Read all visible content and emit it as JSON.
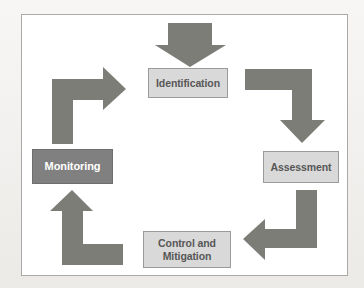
{
  "diagram": {
    "type": "cyclical-process-flow",
    "colors": {
      "arrow_fill": "#7d7d78",
      "node_light_fill": "#d9d9d9",
      "node_light_border": "#9a9a9a",
      "node_light_text": "#575757",
      "node_dark_fill": "#808080",
      "node_dark_border": "#6e6e6e",
      "node_dark_text": "#ffffff",
      "frame_border": "#a9a9a9",
      "canvas_background": "#ffffff"
    },
    "nodes": [
      {
        "id": "identification",
        "label": "Identification",
        "style": "light",
        "order": 1
      },
      {
        "id": "assessment",
        "label": "Assessment",
        "style": "light",
        "order": 2
      },
      {
        "id": "control",
        "label_line1": "Control and",
        "label_line2": "Mitigation",
        "style": "light",
        "order": 3
      },
      {
        "id": "monitoring",
        "label": "Monitoring",
        "style": "dark",
        "order": 4
      }
    ],
    "arrows": [
      {
        "id": "entry-arrow",
        "shape": "straight-down",
        "direction": "down",
        "from": "",
        "to": "identification"
      },
      {
        "id": "identification-to-assessment",
        "shape": "elbow",
        "direction": "right-then-down",
        "from": "identification",
        "to": "assessment"
      },
      {
        "id": "assessment-to-control",
        "shape": "elbow",
        "direction": "down-then-left",
        "from": "assessment",
        "to": "control"
      },
      {
        "id": "control-to-monitoring",
        "shape": "elbow",
        "direction": "left-then-up",
        "from": "control",
        "to": "monitoring"
      },
      {
        "id": "monitoring-to-identification",
        "shape": "elbow",
        "direction": "up-then-right",
        "from": "monitoring",
        "to": "identification"
      }
    ]
  }
}
